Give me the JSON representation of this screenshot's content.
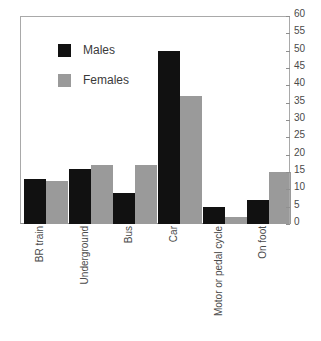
{
  "chart_data": {
    "type": "bar",
    "title": "",
    "subtitle": "",
    "xlabel": "",
    "ylabel": "",
    "ylim": [
      0,
      60
    ],
    "ytick_step": 5,
    "yticks": [
      0,
      5,
      10,
      15,
      20,
      25,
      30,
      35,
      40,
      45,
      50,
      55,
      60
    ],
    "grid": false,
    "legend_position": "upper-left-inside",
    "categories": [
      "BR train",
      "Underground",
      "Bus",
      "Car",
      "Motor or pedal cycle",
      "On foot"
    ],
    "series": [
      {
        "name": "Males",
        "color": "#111111",
        "values": [
          13,
          16,
          9,
          50,
          5,
          7
        ]
      },
      {
        "name": "Females",
        "color": "#9a9a9a",
        "values": [
          12.5,
          17,
          17,
          37,
          2,
          15
        ]
      }
    ]
  },
  "legend": {
    "items": [
      {
        "label": "Males",
        "color": "#111111"
      },
      {
        "label": "Females",
        "color": "#9a9a9a"
      }
    ]
  },
  "axis": {
    "y_tick_labels": [
      "0",
      "5",
      "10",
      "15",
      "20",
      "25",
      "30",
      "35",
      "40",
      "45",
      "50",
      "55",
      "60"
    ]
  }
}
